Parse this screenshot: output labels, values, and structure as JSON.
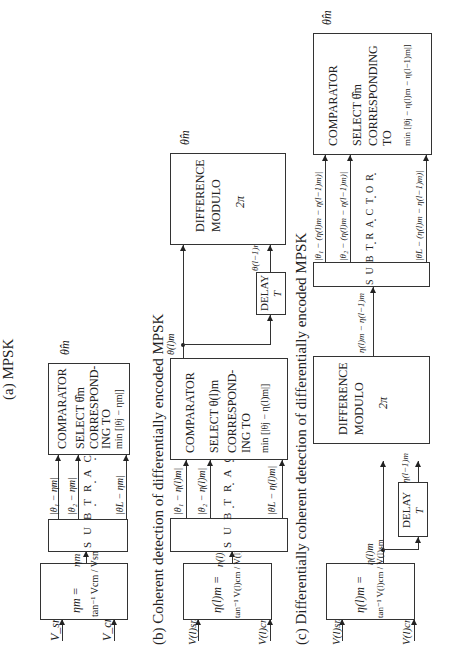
{
  "captions": {
    "a": "(a)  MPSK",
    "b": "(b)  Coherent detection of differentially encoded MPSK",
    "c": "(c)  Differentially coherent detection of differentially encoded MPSK"
  },
  "row_a": {
    "input_s": "V_sm",
    "input_c": "V_cm",
    "arctan_line1": "ηm =",
    "arctan_line2": "tan⁻¹ Vcm / Vsm",
    "eta_label": "ηm",
    "subtractor": "SUBTRACTOR",
    "diff_1": "|θ₁ − ηm|",
    "diff_2": "|θ₂ − ηm|",
    "diff_L": "|θL − ηm|",
    "comparator": [
      "COMPARATOR",
      "SELECT θ̂m",
      "CORRESPOND-",
      "ING TO",
      "min [|θj − ηm|]"
    ],
    "min_sub": "j",
    "output": "θ̂m"
  },
  "row_b": {
    "input_s": "V(l)sm",
    "input_c": "V(l)cm",
    "arctan_line1": "η(l)m =",
    "arctan_line2": "tan⁻¹ V(l)cm / V(l)sm",
    "eta_label": "η(l)m",
    "subtractor": "SUBTRACTOR",
    "diff_1": "|θ₁ − η(l)m|",
    "diff_2": "|θ₂ − η(l)m|",
    "diff_L": "|θL − η(l)m|",
    "comparator": [
      "COMPARATOR",
      "SELECT θ(l)m",
      "CORRESPOND-",
      "ING TO",
      "min [|θj − η(l)m|]"
    ],
    "min_sub": "j",
    "theta_l": "θ(l)m",
    "delay": [
      "DELAY",
      "T"
    ],
    "theta_l_minus_1": "θ(l−1)m",
    "difference": [
      "DIFFERENCE",
      "MODULO",
      "2π"
    ],
    "output": "θ̂m"
  },
  "row_c": {
    "input_s": "V(l)sm",
    "input_c": "V(l)cm",
    "arctan_line1": "η(l)m =",
    "arctan_line2": "tan⁻¹ V(l)cm / V(l)sm",
    "eta_label": "η(l)m",
    "delay": [
      "DELAY",
      "T"
    ],
    "eta_l_minus_1": "η(l−1)m",
    "difference": [
      "DIFFERENCE",
      "MODULO",
      "2π"
    ],
    "diff_out": "η(l)m − η(l−1)m",
    "subtractor": "SUBTRACTOR",
    "diff_1": "|θ₁ − (η(l)m − η(l−1)m)|",
    "diff_2": "|θ₂ − (η(l)m − η(l−1)m)|",
    "diff_L": "|θL − (η(l)m − η(l−1)m)|",
    "comparator": [
      "COMPARATOR",
      "SELECT θ̂m",
      "CORRESPONDING",
      "TO",
      "min [|θj − η(l)m − η(l−1)m|]"
    ],
    "min_sub": "j",
    "output": "θ̂m"
  }
}
